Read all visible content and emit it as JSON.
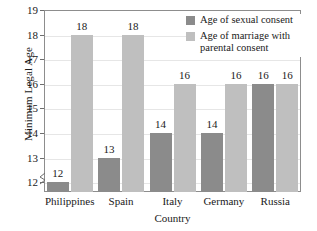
{
  "chart_data": {
    "type": "bar",
    "title": "",
    "xlabel": "Country",
    "ylabel": "Minimum Legal Age",
    "categories": [
      "Philippines",
      "Spain",
      "Italy",
      "Germany",
      "Russia"
    ],
    "series": [
      {
        "name": "Age of sexual consent",
        "color": "#8b8b8b",
        "values": [
          12,
          13,
          14,
          14,
          16
        ]
      },
      {
        "name": "Age of marriage with parental consent",
        "color": "#bfbfbf",
        "values": [
          18,
          18,
          16,
          16,
          16
        ]
      }
    ],
    "ylim": [
      11.6,
      19
    ],
    "yticks": [
      12,
      13,
      14,
      15,
      16,
      17,
      18,
      19
    ],
    "ytick_labels": [
      "12",
      "13",
      "14",
      "15",
      "16",
      "17",
      "18",
      "19"
    ],
    "grid": true,
    "axis_break": true,
    "legend_position": "top-right",
    "data_labels": [
      [
        "12",
        "13",
        "14",
        "14",
        "16"
      ],
      [
        "18",
        "18",
        "16",
        "16",
        "16"
      ]
    ]
  },
  "legend": {
    "entries": [
      {
        "label": "Age of sexual consent"
      },
      {
        "label": "Age of marriage with parental consent"
      }
    ]
  }
}
